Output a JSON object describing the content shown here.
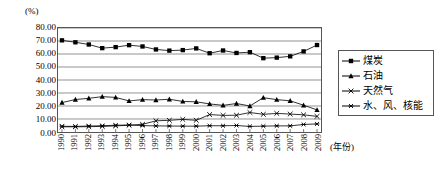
{
  "chart_data": {
    "type": "line",
    "title": "",
    "xlabel": "(年份)",
    "ylabel": "(%)",
    "ylim": [
      0,
      80
    ],
    "ytick_step": 10,
    "grid": "horizontal",
    "legend_position": "right",
    "categories": [
      "1990",
      "1991",
      "1992",
      "1993",
      "1994",
      "1995",
      "1996",
      "1997",
      "1998",
      "1999",
      "2000",
      "2001",
      "2002",
      "2003",
      "2004",
      "2005",
      "2006",
      "2007",
      "2008",
      "2009"
    ],
    "yticks": [
      "0.00",
      "10.00",
      "20.00",
      "30.00",
      "40.00",
      "50.00",
      "60.00",
      "70.00",
      "80.00"
    ],
    "series": [
      {
        "name": "煤炭",
        "marker": "square",
        "values": [
          70.5,
          69.0,
          67.3,
          64.5,
          65.3,
          66.8,
          65.8,
          63.5,
          62.6,
          63.0,
          64.3,
          60.6,
          62.7,
          60.8,
          61.4,
          56.8,
          57.2,
          58.2,
          62.0,
          66.9
        ]
      },
      {
        "name": "石油",
        "marker": "triangle",
        "values": [
          22.6,
          25.0,
          25.9,
          27.2,
          26.6,
          23.9,
          24.9,
          24.6,
          25.2,
          23.5,
          23.2,
          21.6,
          20.5,
          21.9,
          20.0,
          26.4,
          24.9,
          24.0,
          20.6,
          17.0
        ]
      },
      {
        "name": "天然气",
        "marker": "x",
        "values": [
          4.0,
          4.0,
          4.1,
          4.3,
          4.7,
          5.2,
          5.9,
          8.6,
          9.0,
          9.7,
          9.0,
          13.4,
          12.8,
          12.9,
          15.0,
          13.6,
          14.3,
          13.8,
          13.2,
          12.0
        ]
      },
      {
        "name": "水、风、核能",
        "marker": "asterisk",
        "values": [
          4.4,
          4.3,
          4.6,
          4.8,
          5.2,
          5.4,
          4.9,
          4.7,
          4.6,
          4.5,
          4.5,
          4.8,
          4.8,
          5.0,
          4.3,
          4.5,
          4.7,
          4.7,
          5.8,
          6.2
        ]
      }
    ]
  },
  "chart": {
    "unit_label": "(%)",
    "xaxis_name": "(年份)"
  },
  "legend": {
    "items": [
      {
        "label": "煤炭",
        "marker": "square"
      },
      {
        "label": "石油",
        "marker": "triangle"
      },
      {
        "label": "天然气",
        "marker": "x"
      },
      {
        "label": "水、风、核能",
        "marker": "asterisk"
      }
    ]
  }
}
